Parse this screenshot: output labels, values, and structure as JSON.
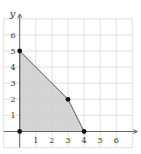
{
  "diagram": {
    "type": "feasible-region",
    "axes": {
      "x_label": "x",
      "y_label": "y",
      "x_ticks": [
        "1",
        "2",
        "3",
        "4",
        "5",
        "6"
      ],
      "y_ticks": [
        "1",
        "2",
        "3",
        "4",
        "5",
        "6"
      ]
    },
    "region": {
      "vertices": [
        [
          0,
          0
        ],
        [
          0,
          5
        ],
        [
          3,
          2
        ],
        [
          4,
          0
        ]
      ],
      "fill": "#cdcdcd",
      "edge": "#555555"
    },
    "points": [
      {
        "x": 0,
        "y": 0
      },
      {
        "x": 0,
        "y": 5
      },
      {
        "x": 3,
        "y": 2
      },
      {
        "x": 4,
        "y": 0
      }
    ],
    "colors": {
      "grid": "#d9d9d9",
      "axis": "#666666",
      "point": "#111111"
    }
  }
}
